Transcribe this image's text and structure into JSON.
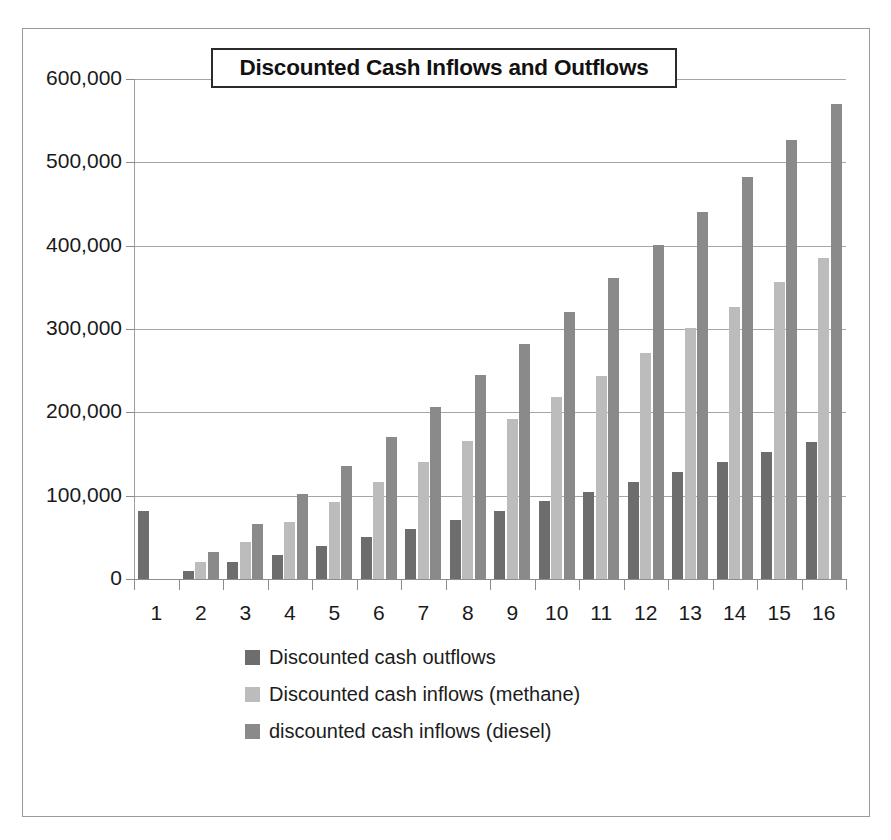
{
  "figure": {
    "title": "Discounted Cash Inflows and Outflows"
  },
  "legend": {
    "items": [
      {
        "label": "Discounted cash outflows",
        "color": "#6d6d6d",
        "swatch_name": "legend-swatch-outflows"
      },
      {
        "label": "Discounted cash inflows (methane)",
        "color": "#bcbcbc",
        "swatch_name": "legend-swatch-methane"
      },
      {
        "label": "discounted cash inflows (diesel)",
        "color": "#8a8a8a",
        "swatch_name": "legend-swatch-diesel"
      }
    ]
  },
  "axes": {
    "y_tick_labels": [
      "600,000",
      "500,000",
      "400,000",
      "300,000",
      "200,000",
      "100,000",
      "0"
    ],
    "x_tick_labels": [
      "1",
      "2",
      "3",
      "4",
      "5",
      "6",
      "7",
      "8",
      "9",
      "10",
      "11",
      "12",
      "13",
      "14",
      "15",
      "16"
    ]
  },
  "chart_data": {
    "type": "bar",
    "title": "Discounted Cash Inflows and Outflows",
    "xlabel": "",
    "ylabel": "",
    "ylim": [
      0,
      600000
    ],
    "ytick_step": 100000,
    "grid": true,
    "legend_position": "bottom",
    "categories": [
      "1",
      "2",
      "3",
      "4",
      "5",
      "6",
      "7",
      "8",
      "9",
      "10",
      "11",
      "12",
      "13",
      "14",
      "15",
      "16"
    ],
    "series": [
      {
        "name": "Discounted cash outflows",
        "color": "#6d6d6d",
        "values": [
          82000,
          10000,
          20000,
          29000,
          40000,
          50000,
          60000,
          71000,
          82000,
          94000,
          105000,
          116000,
          128000,
          140000,
          152000,
          165000
        ]
      },
      {
        "name": "Discounted cash inflows (methane)",
        "color": "#bcbcbc",
        "values": [
          0,
          20000,
          45000,
          68000,
          93000,
          116000,
          141000,
          166000,
          192000,
          218000,
          244000,
          271000,
          301000,
          327000,
          357000,
          385000
        ]
      },
      {
        "name": "discounted cash inflows (diesel)",
        "color": "#8a8a8a",
        "values": [
          0,
          32000,
          66000,
          102000,
          136000,
          171000,
          207000,
          245000,
          282000,
          321000,
          361000,
          401000,
          441000,
          483000,
          527000,
          570000
        ]
      }
    ]
  }
}
